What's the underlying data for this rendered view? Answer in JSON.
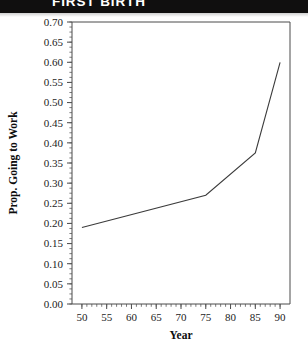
{
  "header": {
    "title": "FIRST BIRTH"
  },
  "chart_data": {
    "type": "line",
    "title": "",
    "xlabel": "Year",
    "ylabel": "Prop. Going to Work",
    "xlim": [
      48,
      92
    ],
    "ylim": [
      0.0,
      0.7
    ],
    "grid": false,
    "legend": false,
    "x_ticks": [
      50,
      55,
      60,
      65,
      70,
      75,
      80,
      85,
      90
    ],
    "x_tick_labels": [
      "50",
      "55",
      "60",
      "65",
      "70",
      "75",
      "80",
      "85",
      "90"
    ],
    "x_minor_step": 1,
    "y_ticks": [
      0.0,
      0.05,
      0.1,
      0.15,
      0.2,
      0.25,
      0.3,
      0.35,
      0.4,
      0.45,
      0.5,
      0.55,
      0.6,
      0.65,
      0.7
    ],
    "y_tick_labels": [
      "0.00",
      "0.05",
      "0.10",
      "0.15",
      "0.20",
      "0.25",
      "0.30",
      "0.35",
      "0.40",
      "0.45",
      "0.50",
      "0.55",
      "0.60",
      "0.65",
      "0.70"
    ],
    "y_minor_step": 0.0125,
    "series": [
      {
        "name": "Prop. Going to Work",
        "x": [
          50,
          75,
          85,
          90
        ],
        "values": [
          0.19,
          0.27,
          0.375,
          0.6
        ]
      }
    ]
  }
}
